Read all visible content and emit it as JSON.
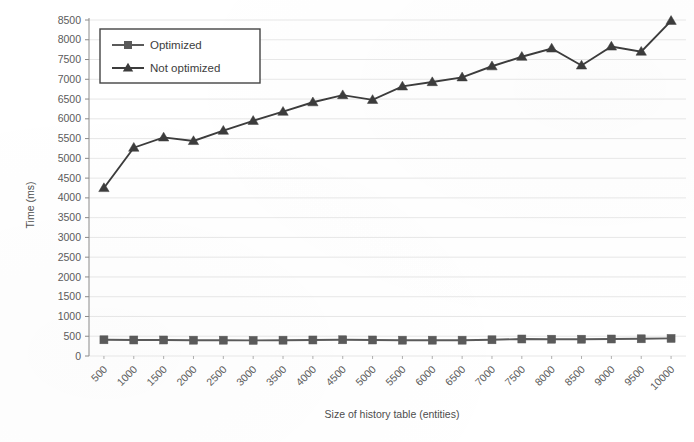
{
  "chart_data": {
    "type": "line",
    "title": "",
    "xlabel": "Size of history table (entities)",
    "ylabel": "Time (ms)",
    "categories": [
      "500",
      "1000",
      "1500",
      "2000",
      "2500",
      "3000",
      "3500",
      "4000",
      "4500",
      "5000",
      "5500",
      "6000",
      "6500",
      "7000",
      "7500",
      "8000",
      "8500",
      "9000",
      "9500",
      "10000"
    ],
    "ylim": [
      0,
      8500
    ],
    "ytick_step": 500,
    "yticks": [
      "0",
      "500",
      "1000",
      "1500",
      "2000",
      "2500",
      "3000",
      "3500",
      "4000",
      "4500",
      "5000",
      "5500",
      "6000",
      "6500",
      "7000",
      "7500",
      "8000",
      "8500"
    ],
    "grid": true,
    "legend_position": "top-left",
    "series": [
      {
        "name": "Optimized",
        "marker": "square",
        "color": "#5a5a5a",
        "values": [
          410,
          405,
          405,
          400,
          400,
          395,
          400,
          405,
          410,
          405,
          400,
          400,
          400,
          410,
          430,
          425,
          425,
          430,
          435,
          445
        ]
      },
      {
        "name": "Not optimized",
        "marker": "triangle",
        "color": "#3c3c3c",
        "values": [
          4250,
          5270,
          5530,
          5440,
          5700,
          5950,
          6180,
          6420,
          6600,
          6480,
          6820,
          6930,
          7050,
          7330,
          7570,
          7780,
          7350,
          7830,
          7700,
          8480
        ]
      }
    ]
  },
  "legend": {
    "entries": [
      {
        "label": "Optimized"
      },
      {
        "label": "Not optimized"
      }
    ]
  },
  "axes": {
    "y_title": "Time (ms)",
    "x_title": "Size of history table (entities)"
  }
}
